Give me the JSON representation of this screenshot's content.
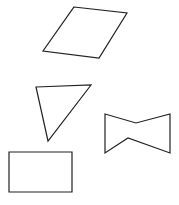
{
  "canvas": {
    "width": 179,
    "height": 205,
    "background": "#ffffff",
    "stroke_color": "#222222"
  },
  "shapes": [
    {
      "id": "parallelogram",
      "type": "parallelogram",
      "points": "74,7 127,13 99,58 43,51"
    },
    {
      "id": "triangle",
      "type": "triangle",
      "points": "36,87 91,85 48,141"
    },
    {
      "id": "bowtie",
      "type": "bowtie-hexagon",
      "points": "105,114 136,123 170,114 170,153 128,138 105,153"
    },
    {
      "id": "rectangle",
      "type": "rectangle",
      "points": "9,152 72,152 72,192 9,192"
    }
  ]
}
